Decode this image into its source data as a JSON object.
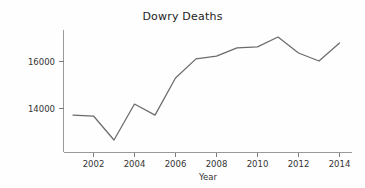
{
  "chart_data": {
    "type": "line",
    "title": "Dowry Deaths",
    "xlabel": "Year",
    "ylabel": "",
    "grid": false,
    "legend": "none",
    "line_color": "#6b6b6b",
    "x": [
      2001,
      2002,
      2003,
      2004,
      2005,
      2006,
      2007,
      2008,
      2009,
      2010,
      2011,
      2012,
      2013,
      2014
    ],
    "values": [
      13720,
      13680,
      12660,
      14190,
      13720,
      15300,
      16110,
      16230,
      16580,
      16620,
      17040,
      16360,
      16020,
      16790
    ],
    "series": [
      {
        "name": "Dowry Deaths",
        "values": [
          13720,
          13680,
          12660,
          14190,
          13720,
          15300,
          16110,
          16230,
          16580,
          16620,
          17040,
          16360,
          16020,
          16790
        ]
      }
    ],
    "xlim": [
      2000.8,
      2014.3
    ],
    "ylim": [
      12420,
      17300
    ],
    "xticks": [
      2002,
      2004,
      2006,
      2008,
      2010,
      2012,
      2014
    ],
    "xtick_labels": [
      "2002",
      "2004",
      "2006",
      "2008",
      "2010",
      "2012",
      "2014"
    ],
    "yticks": [
      14000,
      16000
    ],
    "ytick_labels": [
      "14000",
      "16000"
    ]
  },
  "figure": {
    "background_color": "#fefefe",
    "axis_color": "#9a9a9a",
    "text_color": "#333333"
  }
}
